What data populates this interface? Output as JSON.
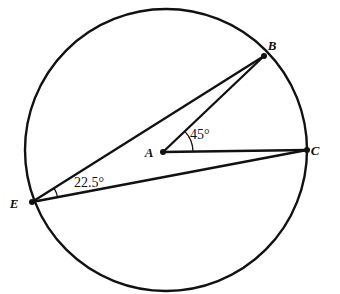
{
  "figure": {
    "background_color": "#ffffff",
    "stroke_color": "#111111",
    "circle": {
      "center_label": "A",
      "center_x": 166,
      "center_y": 150,
      "radius": 141
    },
    "points": [
      {
        "label": "A",
        "role": "center",
        "x": 163,
        "y": 152,
        "label_x": 149,
        "label_y": 157,
        "dot": true
      },
      {
        "label": "B",
        "role": "on-circumference",
        "x": 264,
        "y": 56,
        "label_x": 272,
        "label_y": 50,
        "dot": true
      },
      {
        "label": "C",
        "role": "on-circumference",
        "x": 307,
        "y": 150,
        "label_x": 315,
        "label_y": 155,
        "dot": true
      },
      {
        "label": "E",
        "role": "on-circumference",
        "x": 32,
        "y": 202,
        "label_x": 14,
        "label_y": 208,
        "dot": true
      }
    ],
    "segments": [
      {
        "name": "segment-AB",
        "from": "A",
        "to": "B",
        "x1": 163,
        "y1": 152,
        "x2": 264,
        "y2": 56
      },
      {
        "name": "segment-AC",
        "from": "A",
        "to": "C",
        "x1": 163,
        "y1": 152,
        "x2": 307,
        "y2": 150
      },
      {
        "name": "segment-EB",
        "from": "E",
        "to": "B",
        "x1": 32,
        "y1": 202,
        "x2": 264,
        "y2": 56
      },
      {
        "name": "segment-EC",
        "from": "E",
        "to": "C",
        "x1": 32,
        "y1": 202,
        "x2": 307,
        "y2": 150
      }
    ],
    "angles": [
      {
        "name": "central-angle-BAC",
        "vertex": "A",
        "rays": [
          "B",
          "C"
        ],
        "value": "45°",
        "label_x": 190,
        "label_y": 139,
        "arc_radius": 30,
        "arc_start_deg": -0.8,
        "arc_end_deg": -43.5
      },
      {
        "name": "inscribed-angle-BEC",
        "vertex": "E",
        "rays": [
          "B",
          "C"
        ],
        "value": "22.5°",
        "label_x": 74,
        "label_y": 187,
        "arc_radius": 26,
        "arc_start_deg": -10.7,
        "arc_end_deg": -32.2
      }
    ]
  }
}
